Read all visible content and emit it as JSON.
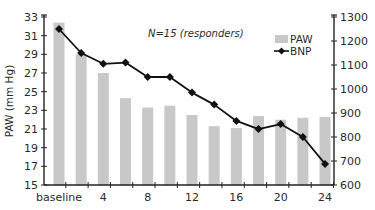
{
  "chart_data": {
    "type": "bar+line",
    "title": "",
    "annotation": "N=15 (responders)",
    "categories": [
      "baseline",
      "2",
      "4",
      "6",
      "8",
      "10",
      "12",
      "14",
      "16",
      "18",
      "20",
      "22",
      "24"
    ],
    "x_tick_labels": [
      "baseline",
      "4",
      "8",
      "12",
      "16",
      "20",
      "24"
    ],
    "xlabel": "",
    "series": [
      {
        "name": "PAW",
        "type": "bar",
        "axis": "left",
        "color": "#c8c8c8",
        "values": [
          32.4,
          29.0,
          27.0,
          24.3,
          23.3,
          23.5,
          22.5,
          21.3,
          21.1,
          22.4,
          22.0,
          22.2,
          22.3
        ]
      },
      {
        "name": "BNP",
        "type": "line",
        "axis": "right",
        "color": "#111111",
        "marker": "diamond",
        "values": [
          1250,
          1150,
          1105,
          1110,
          1050,
          1050,
          985,
          935,
          867,
          833,
          854,
          800,
          688
        ]
      }
    ],
    "left_axis": {
      "label": "PAW (mm Hg)",
      "ylim": [
        15,
        33
      ],
      "ticks": [
        15,
        17,
        19,
        21,
        23,
        25,
        27,
        29,
        31,
        33
      ]
    },
    "right_axis": {
      "label": "",
      "ylim": [
        600,
        1300
      ],
      "ticks": [
        600,
        700,
        800,
        900,
        1000,
        1100,
        1200,
        1300
      ]
    },
    "grid": false,
    "legend": {
      "position": "upper-right-inside",
      "entries": [
        {
          "label": "PAW",
          "symbol": "bar-swatch"
        },
        {
          "label": "BNP",
          "symbol": "line-diamond"
        }
      ]
    }
  }
}
